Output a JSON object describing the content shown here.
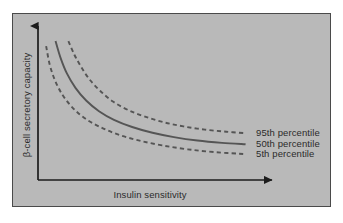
{
  "figure": {
    "background_color": "#ffffff",
    "panel_color": "#b9b9b9",
    "panel_border_color": "#4a4a4a",
    "axis_color": "#1c1c1c",
    "curve_color": "#555555",
    "text_color": "#2b2b2b"
  },
  "chart_data": {
    "type": "line",
    "title": "",
    "subtitle": "",
    "xlabel": "Insulin sensitivity",
    "ylabel": "β-cell secretory capacity",
    "grid": false,
    "axis_ticks": false,
    "axis_tick_labels": [],
    "axis_style": "arrow",
    "xlim": [
      0,
      1
    ],
    "ylim": [
      0,
      1
    ],
    "legend_position": "right-inline",
    "annotation": "Hyperbolic relationship between insulin sensitivity and beta-cell secretory capacity; curves show percentile bands of the disposition index.",
    "series": [
      {
        "name": "95th percentile",
        "label": "95th percentile",
        "style": "dashed",
        "color": "#555555",
        "constant_k": 0.255,
        "x": [
          0.142,
          0.17,
          0.2,
          0.24,
          0.29,
          0.35,
          0.42,
          0.5,
          0.59,
          0.68,
          0.78,
          0.88,
          0.97
        ],
        "y": [
          0.965,
          0.87,
          0.79,
          0.7,
          0.62,
          0.545,
          0.487,
          0.44,
          0.4,
          0.372,
          0.35,
          0.335,
          0.325
        ]
      },
      {
        "name": "50th percentile",
        "label": "50th percentile",
        "style": "solid",
        "color": "#555555",
        "constant_k": 0.16,
        "x": [
          0.082,
          0.105,
          0.135,
          0.175,
          0.225,
          0.285,
          0.355,
          0.44,
          0.535,
          0.635,
          0.745,
          0.86,
          0.97
        ],
        "y": [
          0.965,
          0.85,
          0.74,
          0.64,
          0.552,
          0.478,
          0.418,
          0.368,
          0.328,
          0.298,
          0.274,
          0.258,
          0.248
        ]
      },
      {
        "name": "5th percentile",
        "label": "5th percentile",
        "style": "dashed",
        "color": "#555555",
        "constant_k": 0.088,
        "x": [
          0.038,
          0.055,
          0.08,
          0.115,
          0.16,
          0.215,
          0.285,
          0.37,
          0.47,
          0.58,
          0.7,
          0.83,
          0.97
        ],
        "y": [
          0.93,
          0.8,
          0.69,
          0.59,
          0.505,
          0.432,
          0.372,
          0.318,
          0.275,
          0.24,
          0.213,
          0.193,
          0.18
        ]
      }
    ]
  }
}
